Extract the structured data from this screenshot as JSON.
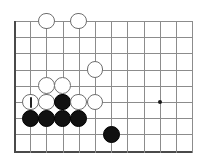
{
  "figure": {
    "kind": "go-board-diagram",
    "width": 209,
    "height": 167,
    "background_color": "#ffffff"
  },
  "board": {
    "origin_x": 14,
    "origin_y": 21,
    "cell_size": 16.2,
    "columns": 11,
    "rows": 8,
    "line_color": "#8c8c8c",
    "edge_color": "#4a4a4a",
    "line_width": 1,
    "edge_width": 2,
    "left_edge_is_board_border": true,
    "bottom_edge_is_board_border": true,
    "star_points": [
      {
        "col": 9,
        "row": 5
      }
    ],
    "star_point_color": "#1a1a1a",
    "star_point_size": 4
  },
  "stones": {
    "radius": 8.4,
    "black_color": "#111111",
    "white_color": "#ffffff",
    "white_outline_color": "#6e6e6e",
    "items": [
      {
        "col": 2,
        "row": 0,
        "color": "white",
        "mark": "none"
      },
      {
        "col": 4,
        "row": 0,
        "color": "white",
        "mark": "none"
      },
      {
        "col": 5,
        "row": 3,
        "color": "white",
        "mark": "none"
      },
      {
        "col": 2,
        "row": 4,
        "color": "white",
        "mark": "none"
      },
      {
        "col": 3,
        "row": 4,
        "color": "white",
        "mark": "none"
      },
      {
        "col": 1,
        "row": 5,
        "color": "white",
        "mark": "vertical-stroke"
      },
      {
        "col": 2,
        "row": 5,
        "color": "white",
        "mark": "none"
      },
      {
        "col": 3,
        "row": 5,
        "color": "black",
        "mark": "none"
      },
      {
        "col": 4,
        "row": 5,
        "color": "white",
        "mark": "none"
      },
      {
        "col": 5,
        "row": 5,
        "color": "white",
        "mark": "none"
      },
      {
        "col": 1,
        "row": 6,
        "color": "black",
        "mark": "none"
      },
      {
        "col": 2,
        "row": 6,
        "color": "black",
        "mark": "none"
      },
      {
        "col": 3,
        "row": 6,
        "color": "black",
        "mark": "none"
      },
      {
        "col": 4,
        "row": 6,
        "color": "black",
        "mark": "none"
      },
      {
        "col": 6,
        "row": 7,
        "color": "black",
        "mark": "none"
      }
    ]
  }
}
